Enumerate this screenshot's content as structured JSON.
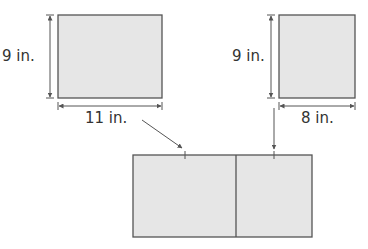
{
  "colors": {
    "fill": "#e6e6e6",
    "stroke": "#555555",
    "text": "#333333",
    "arrow": "#555555"
  },
  "shapes": {
    "left_rect": {
      "height_label": "9 in.",
      "width_label": "11 in."
    },
    "right_rect": {
      "height_label": "9 in.",
      "width_label": "8 in."
    },
    "combined_rect": {
      "sections": 2
    }
  }
}
